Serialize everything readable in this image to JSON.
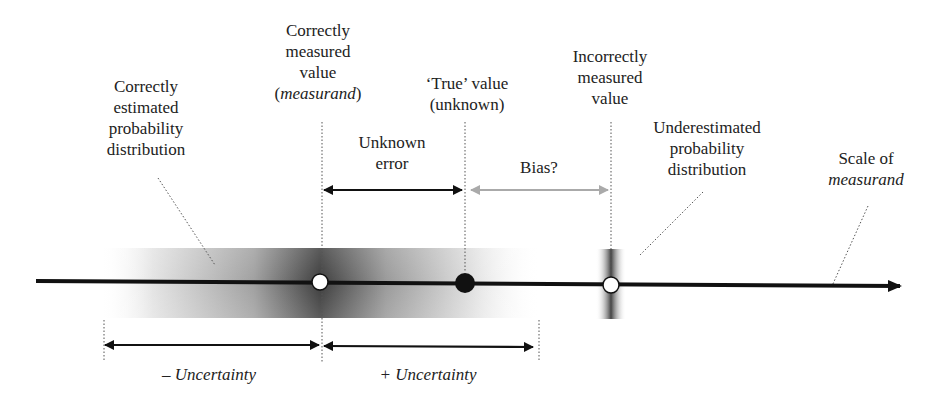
{
  "diagram": {
    "labels": {
      "correct_distribution": [
        "Correctly",
        "estimated",
        "probability",
        "distribution"
      ],
      "correct_value": {
        "lines": [
          "Correctly",
          "measured",
          "value"
        ],
        "italic_line_prefix": "(",
        "italic_line_word": "measurand",
        "italic_line_suffix": ")"
      },
      "true_value": [
        "‘True’ value",
        "(unknown)"
      ],
      "incorrect_value": [
        "Incorrectly",
        "measured",
        "value"
      ],
      "underestimated_distribution": [
        "Underestimated",
        "probability",
        "distribution"
      ],
      "scale": {
        "line1": "Scale of",
        "line2_italic": "measurand"
      },
      "unknown_error": [
        "Unknown",
        "error"
      ],
      "bias": "Bias?",
      "minus_uncertainty": "– Uncertainty",
      "plus_uncertainty": "+ Uncertainty"
    },
    "points": [
      {
        "name": "correctly-measured-value",
        "x": 320,
        "style": "open-circle"
      },
      {
        "name": "true-value",
        "x": 465,
        "style": "filled-circle"
      },
      {
        "name": "incorrectly-measured-value",
        "x": 611,
        "style": "open-circle"
      }
    ],
    "colors": {
      "axis": "#111111",
      "bias_arrow": "#aaaaaa",
      "distribution_dark": "#333333",
      "leader_line": "#555555"
    }
  }
}
